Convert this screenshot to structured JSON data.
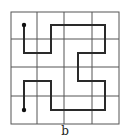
{
  "figure": {
    "label": "b",
    "grid": {
      "rows": 4,
      "cols": 4,
      "x_lines": [
        11,
        37,
        64,
        92,
        119
      ],
      "y_lines": [
        12,
        39,
        67,
        96,
        124
      ],
      "line_color": "#555555"
    },
    "path": {
      "color": "#2a2a2a",
      "cells": [
        [
          0,
          0
        ],
        [
          0,
          1
        ],
        [
          1,
          1
        ],
        [
          1,
          0
        ],
        [
          2,
          0
        ],
        [
          3,
          0
        ],
        [
          3,
          1
        ],
        [
          2,
          1
        ],
        [
          2,
          2
        ],
        [
          3,
          2
        ],
        [
          3,
          3
        ],
        [
          2,
          3
        ],
        [
          1,
          3
        ],
        [
          1,
          2
        ],
        [
          0,
          2
        ],
        [
          0,
          3
        ]
      ],
      "points": "24,25 24,53 51,53 51,25 105,25 105,53 78,53 78,81 105,81 105,110 51,110 51,81 24,81 24,110",
      "start": {
        "x": 24,
        "y": 25
      },
      "end": {
        "x": 24,
        "y": 110
      }
    }
  }
}
